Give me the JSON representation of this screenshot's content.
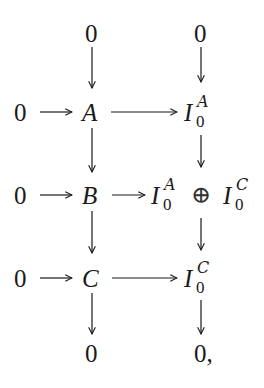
{
  "diagram": {
    "type": "commutative-diagram",
    "top_row": {
      "left": "0",
      "right": "0"
    },
    "row_a": {
      "zero": "0",
      "object": "A",
      "target_base": "I",
      "target_sub": "0",
      "target_sup": "A"
    },
    "row_b": {
      "zero": "0",
      "object": "B",
      "target_left_base": "I",
      "target_left_sub": "0",
      "target_left_sup": "A",
      "oplus": "⊕",
      "target_right_base": "I",
      "target_right_sub": "0",
      "target_right_sup": "C"
    },
    "row_c": {
      "zero": "0",
      "object": "C",
      "target_base": "I",
      "target_sub": "0",
      "target_sup": "C"
    },
    "bottom_row": {
      "left": "0",
      "right": "0,"
    },
    "arrows": [
      {
        "from": "0",
        "to": "A",
        "dir": "down"
      },
      {
        "from": "0",
        "to": "I_0^A",
        "dir": "down"
      },
      {
        "from": "0",
        "to": "A",
        "dir": "right"
      },
      {
        "from": "A",
        "to": "I_0^A",
        "dir": "right"
      },
      {
        "from": "A",
        "to": "B",
        "dir": "down"
      },
      {
        "from": "I_0^A",
        "to": "I_0^A ⊕ I_0^C",
        "dir": "down"
      },
      {
        "from": "0",
        "to": "B",
        "dir": "right"
      },
      {
        "from": "B",
        "to": "I_0^A ⊕ I_0^C",
        "dir": "right"
      },
      {
        "from": "B",
        "to": "C",
        "dir": "down"
      },
      {
        "from": "I_0^A ⊕ I_0^C",
        "to": "I_0^C",
        "dir": "down"
      },
      {
        "from": "0",
        "to": "C",
        "dir": "right"
      },
      {
        "from": "C",
        "to": "I_0^C",
        "dir": "right"
      },
      {
        "from": "C",
        "to": "0",
        "dir": "down"
      },
      {
        "from": "I_0^C",
        "to": "0",
        "dir": "down"
      }
    ]
  }
}
